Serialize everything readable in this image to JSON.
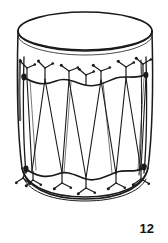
{
  "figure": {
    "caption": "12",
    "style": "black and white line drawing",
    "background_color": "#ffffff",
    "ink_color": "#1a1a1a",
    "canvas": {
      "width": 168,
      "height": 243
    }
  },
  "drawing": {
    "head_label": "drum head",
    "body_label": "drum shell",
    "top_rim_label": "top rim hoop",
    "bottom_rim_label": "bottom rim hoop",
    "top_rope_label": "top rope band",
    "bottom_rope_label": "bottom rope band",
    "lacing_label": "zigzag rope lacing",
    "hook_label": "tension hook",
    "side_rope_label": "side rope"
  },
  "geometry": {
    "top_ellipse": {
      "cx": 85,
      "cy": 31,
      "rx": 67,
      "ry": 19
    },
    "rim_ellipse": {
      "cx": 85,
      "cy": 50,
      "rx": 67,
      "ry": 19
    },
    "body_left_x": 18,
    "body_right_x": 152,
    "body_top_y": 31,
    "body_bottom_y": 196,
    "bottom_ellipse": {
      "cx": 85,
      "cy": 196,
      "rx": 63,
      "ry": 17
    },
    "top_band_y": 78,
    "bottom_band_y": 172,
    "hook_count_top": 7,
    "hook_count_bottom": 6,
    "lacing_vertex_count": 9
  }
}
